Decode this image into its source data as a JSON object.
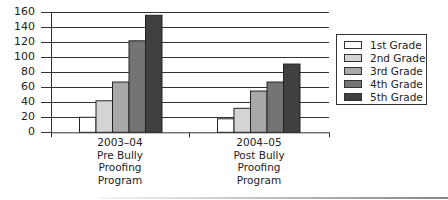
{
  "chart_data": {
    "type": "bar",
    "title": "",
    "xlabel": "",
    "ylabel": "",
    "ylim": [
      0,
      160
    ],
    "yticks": [
      0,
      20,
      40,
      60,
      80,
      100,
      120,
      140,
      160
    ],
    "grid": true,
    "legend_position": "right",
    "categories": [
      "2003–04 Pre Bully Proofing Program",
      "2004–05 Post Bully Proofing Program"
    ],
    "category_label_lines": [
      [
        "2003–04",
        "Pre Bully",
        "Proofing",
        "Program"
      ],
      [
        "2004–05",
        "Post Bully",
        "Proofing",
        "Program"
      ]
    ],
    "series": [
      {
        "name": "1st Grade",
        "color": "#ffffff",
        "values": [
          20,
          18
        ]
      },
      {
        "name": "2nd Grade",
        "color": "#d4d4d4",
        "values": [
          42,
          32
        ]
      },
      {
        "name": "3rd Grade",
        "color": "#a8a8a8",
        "values": [
          67,
          55
        ]
      },
      {
        "name": "4th Grade",
        "color": "#747474",
        "values": [
          122,
          67
        ]
      },
      {
        "name": "5th Grade",
        "color": "#404040",
        "values": [
          156,
          91
        ]
      }
    ]
  },
  "legend": {
    "items": [
      "1st Grade",
      "2nd Grade",
      "3rd Grade",
      "4th Grade",
      "5th Grade"
    ]
  }
}
